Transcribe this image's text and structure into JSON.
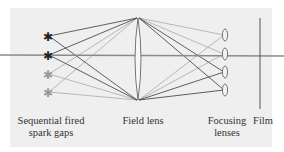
{
  "diagram": {
    "labels": {
      "spark_gaps_line1": "Sequential fired",
      "spark_gaps_line2": "spark gaps",
      "field_lens": "Field lens",
      "focusing_line1": "Focusing",
      "focusing_line2": "lenses",
      "film": "Film"
    },
    "colors": {
      "background": "#efefef",
      "axis": "#8a8a8a",
      "ray_dark": "#3a3a3a",
      "ray_light": "#a8a8a8",
      "star_dark": "#222222",
      "star_light": "#9a9a9a",
      "lens": "#666666",
      "film": "#555555"
    },
    "spark_gaps": [
      {
        "y": 36,
        "shade": "dark"
      },
      {
        "y": 55,
        "shade": "dark"
      },
      {
        "y": 74,
        "shade": "light"
      },
      {
        "y": 92,
        "shade": "light"
      }
    ],
    "focusing_lenses": [
      {
        "y": 35
      },
      {
        "y": 54
      },
      {
        "y": 72
      },
      {
        "y": 90
      }
    ]
  }
}
